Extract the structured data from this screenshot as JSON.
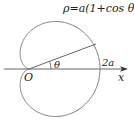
{
  "diagram": {
    "equation": "ρ=a(1+cos θ)",
    "origin_label": "O",
    "angle_label": "θ",
    "point_label": "2a",
    "axis_label": "x",
    "curve_type": "cardioid",
    "colors": {
      "curve": "#7a7a7a",
      "axis": "#555555",
      "text": "#222222"
    }
  }
}
